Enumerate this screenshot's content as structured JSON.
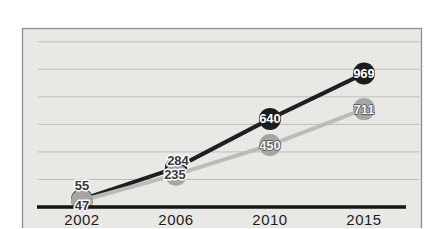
{
  "figure": {
    "background": "#ffffff"
  },
  "chart_data": {
    "type": "line",
    "title": "",
    "xlabel": "",
    "ylabel": "",
    "categories": [
      "2002",
      "2006",
      "2010",
      "2015"
    ],
    "series": [
      {
        "name": "dark-series",
        "line_color": "#1f1f1f",
        "marker_color": "#1c1c1c",
        "values": [
          55,
          284,
          640,
          969
        ],
        "labels": [
          {
            "text": "55",
            "style": "halo",
            "dx": 0,
            "dy": -14
          },
          {
            "text": "284",
            "style": "halo",
            "dx": 2,
            "dy": -7
          },
          {
            "text": "640",
            "style": "inverse",
            "dx": 0,
            "dy": 0
          },
          {
            "text": "969",
            "style": "inverse",
            "dx": 0,
            "dy": 0
          }
        ]
      },
      {
        "name": "light-series",
        "line_color": "#bbbbb8",
        "marker_color": "#a5a5a2",
        "values": [
          47,
          235,
          450,
          711
        ],
        "labels": [
          {
            "text": "47",
            "style": "halo",
            "dx": 0,
            "dy": 5
          },
          {
            "text": "235",
            "style": "halo",
            "dx": -1,
            "dy": 0
          },
          {
            "text": "450",
            "style": "outline",
            "dx": 0,
            "dy": 0
          },
          {
            "text": "711",
            "style": "outline",
            "dx": 0,
            "dy": 0
          }
        ]
      }
    ],
    "ylim": [
      0,
      1300
    ],
    "grid": true,
    "grid_values": [
      200,
      400,
      600,
      800,
      1000,
      1200
    ],
    "legend": false,
    "colors": {
      "plot_background": "#e8e8e5",
      "frame_border": "#8f8f8f",
      "gridline": "#bdbdba",
      "axis": "#151515",
      "tick_label": "#1d1d1d",
      "halo_label_fill": "#383838",
      "halo_label_stroke": "#ffffff",
      "inverse_label_fill": "#ffffff",
      "outline_label_fill": "#f4f4f1",
      "outline_label_stroke": "#4d4d4d"
    }
  }
}
